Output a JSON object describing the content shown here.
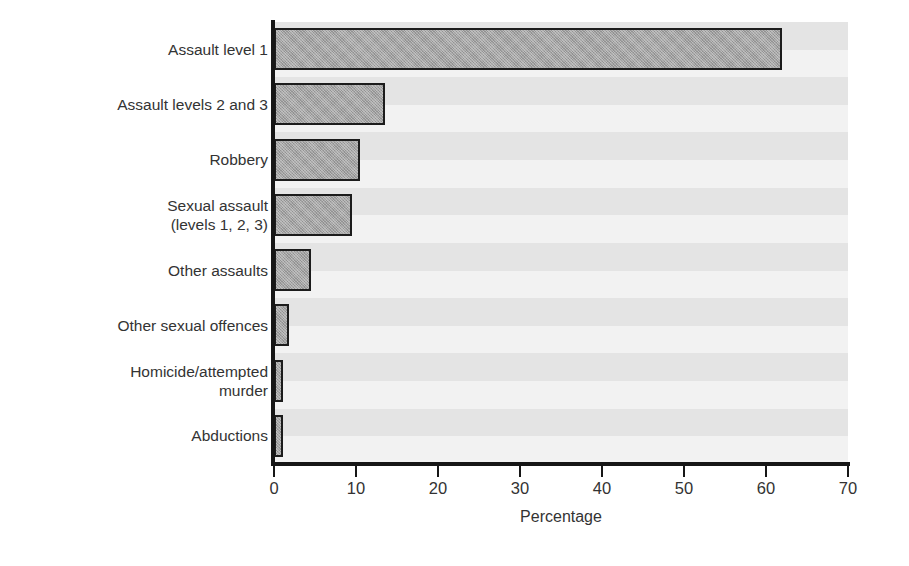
{
  "chart_data": {
    "type": "bar",
    "orientation": "horizontal",
    "title": "",
    "subtitle": "",
    "xlabel": "Percentage",
    "ylabel": "",
    "xlim": [
      0,
      70
    ],
    "xticks": [
      0,
      10,
      20,
      30,
      40,
      50,
      60,
      70
    ],
    "xtick_labels": [
      "0",
      "10",
      "20",
      "30",
      "40",
      "50",
      "60",
      "70"
    ],
    "grid": false,
    "legend": null,
    "legend_position": "none",
    "annotations": [],
    "categories": [
      "Assault level 1",
      "Assault levels 2 and  3",
      "Robbery",
      "Sexual assault\n(levels 1, 2, 3)",
      "Other assaults",
      "Other sexual offences",
      "Homicide/attempted\nmurder",
      "Abductions"
    ],
    "values": [
      62,
      13.5,
      10.5,
      9.5,
      4.5,
      1.8,
      1.1,
      1.1
    ],
    "bar_fill_color": "#a3a3a3",
    "bar_border_color": "#1c1c1c",
    "background_stripe_colors": [
      "#e4e4e4",
      "#f2f2f2"
    ],
    "axis_color": "#161616"
  }
}
